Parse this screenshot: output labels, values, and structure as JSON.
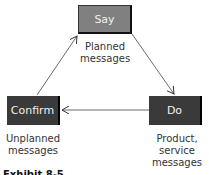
{
  "diagram": {
    "nodes": {
      "say": {
        "label": "Say",
        "caption_line1": "Planned",
        "caption_line2": "messages"
      },
      "do": {
        "label": "Do",
        "caption_line1": "Product,",
        "caption_line2": "service",
        "caption_line3": "messages"
      },
      "confirm": {
        "label": "Confirm",
        "caption_line1": "Unplanned",
        "caption_line2": "messages"
      }
    },
    "edges": [
      {
        "from": "Say",
        "to": "Do"
      },
      {
        "from": "Do",
        "to": "Confirm"
      },
      {
        "from": "Confirm",
        "to": "Say"
      }
    ],
    "colors": {
      "say_fill": "#808080",
      "dark_fill": "#3a3a3a",
      "text_light": "#f0f0f0"
    },
    "caption": "Exhibit 8-5"
  }
}
